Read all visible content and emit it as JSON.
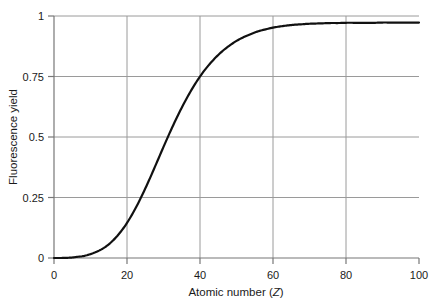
{
  "chart_data": {
    "type": "line",
    "title": "",
    "subtitle": "",
    "xlabel": "Atomic number (Z)",
    "xlabel_plain": "Atomic number (",
    "xlabel_italic": "Z",
    "xlabel_close": ")",
    "ylabel": "Fluorescence yield",
    "xlim": [
      0,
      100
    ],
    "ylim": [
      0,
      1
    ],
    "xticks": [
      0,
      20,
      40,
      60,
      80,
      100
    ],
    "xticklabels": [
      "0",
      "20",
      "40",
      "60",
      "80",
      "100"
    ],
    "yticks": [
      0,
      0.25,
      0.5,
      0.75,
      1
    ],
    "yticklabels": [
      "0",
      "0.25",
      "0.5",
      "0.75",
      "1"
    ],
    "grid": "horizontal-and-vertical",
    "gridlines_x": [
      20,
      40,
      60,
      80
    ],
    "gridlines_y": [
      0.25,
      0.5,
      0.75,
      1
    ],
    "legend": null,
    "legend_position": "none",
    "series": [
      {
        "name": "Fluorescence yield",
        "color": "#111111",
        "linewidth": 2.2,
        "x": [
          0,
          2,
          4,
          5,
          6,
          8,
          10,
          12,
          14,
          16,
          18,
          20,
          22,
          24,
          26,
          28,
          30,
          32,
          34,
          36,
          38,
          40,
          42,
          44,
          46,
          48,
          50,
          52,
          54,
          56,
          58,
          60,
          62,
          64,
          66,
          68,
          70,
          72,
          74,
          76,
          78,
          80,
          82,
          84,
          86,
          88,
          90,
          92,
          94,
          96,
          98,
          100
        ],
        "y": [
          0.0,
          0.0,
          0.001,
          0.002,
          0.004,
          0.008,
          0.016,
          0.028,
          0.045,
          0.07,
          0.103,
          0.145,
          0.196,
          0.255,
          0.32,
          0.389,
          0.459,
          0.527,
          0.591,
          0.65,
          0.703,
          0.75,
          0.79,
          0.824,
          0.853,
          0.877,
          0.897,
          0.913,
          0.926,
          0.937,
          0.945,
          0.952,
          0.957,
          0.961,
          0.964,
          0.966,
          0.968,
          0.969,
          0.97,
          0.971,
          0.971,
          0.972,
          0.972,
          0.972,
          0.972,
          0.972,
          0.973,
          0.973,
          0.973,
          0.973,
          0.973,
          0.973
        ]
      }
    ]
  },
  "axes": {
    "y_axis_name": "fluorescence-yield-axis",
    "x_axis_name": "atomic-number-axis"
  },
  "colors": {
    "curve": "#111111",
    "grid": "#9a9a9a",
    "axis": "#7a7a7a",
    "text": "#1a1a1a",
    "background": "#ffffff"
  }
}
